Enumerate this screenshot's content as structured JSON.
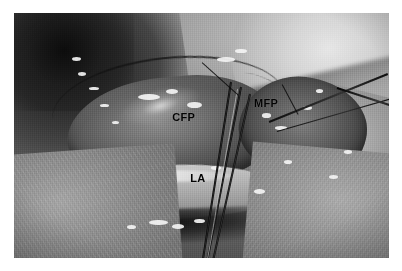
{
  "figure": {
    "kind": "clinical-photograph",
    "modality": "intraoperative grayscale photograph",
    "alt": "Grayscale intraoperative photograph of a surgical field showing exposed fat pads retracted with forceps, annotated with three anatomical abbreviations",
    "background_color": "#ffffff",
    "border_color": "#ffffff",
    "tone": "grayscale"
  },
  "photo": {
    "x": 14,
    "y": 13,
    "width": 375,
    "height": 245
  },
  "labels": [
    {
      "id": "cfp",
      "text": "CFP",
      "meaning": "central fat pad",
      "x_pct": 42.2,
      "y_pct": 40.5,
      "color": "#0a0a09"
    },
    {
      "id": "mfp",
      "text": "MFP",
      "meaning": "medial fat pad",
      "x_pct": 64.0,
      "y_pct": 34.5,
      "color": "#0a0a09"
    },
    {
      "id": "la",
      "text": "LA",
      "meaning": "lower alveolus",
      "x_pct": 47.0,
      "y_pct": 65.5,
      "color": "#0a0a09"
    }
  ],
  "pointers": [
    {
      "id": "pointer-cfp",
      "target": "CFP"
    },
    {
      "id": "pointer-mfp",
      "target": "MFP"
    }
  ],
  "instruments": [
    {
      "id": "forceps",
      "description": "fine forceps entering from lower right, three dark shafts"
    },
    {
      "id": "suture-retractor-right",
      "description": "thin dark retractor / suture at right edge"
    }
  ],
  "regions": [
    {
      "id": "dark-upper-left",
      "description": "dark haemorrhagic tissue, upper left"
    },
    {
      "id": "bright-upper-right",
      "description": "pale smooth rounded soft-tissue mass, upper right"
    },
    {
      "id": "cfp-lobe",
      "description": "central lobulated fat pad"
    },
    {
      "id": "mfp-lobe",
      "description": "medial fat pad lobe"
    },
    {
      "id": "la-band",
      "description": "pale lower alveolar band"
    },
    {
      "id": "lower-dark-band",
      "description": "dark band with specular highlights along lower margin"
    }
  ],
  "specular_highlights": [
    {
      "x_pct": 33.0,
      "y_pct": 33.0,
      "w": 6.0,
      "h": 2.6
    },
    {
      "x_pct": 40.5,
      "y_pct": 31.0,
      "w": 3.2,
      "h": 2.0
    },
    {
      "x_pct": 46.0,
      "y_pct": 36.5,
      "w": 4.0,
      "h": 2.4
    },
    {
      "x_pct": 54.0,
      "y_pct": 18.0,
      "w": 5.0,
      "h": 2.0
    },
    {
      "x_pct": 59.0,
      "y_pct": 14.5,
      "w": 3.0,
      "h": 1.8
    },
    {
      "x_pct": 66.0,
      "y_pct": 41.0,
      "w": 2.6,
      "h": 1.8
    },
    {
      "x_pct": 69.5,
      "y_pct": 46.0,
      "w": 3.4,
      "h": 1.6
    },
    {
      "x_pct": 77.0,
      "y_pct": 38.0,
      "w": 2.4,
      "h": 1.6
    },
    {
      "x_pct": 80.5,
      "y_pct": 31.0,
      "w": 2.0,
      "h": 1.6
    },
    {
      "x_pct": 17.0,
      "y_pct": 24.0,
      "w": 2.2,
      "h": 1.6
    },
    {
      "x_pct": 20.0,
      "y_pct": 30.0,
      "w": 2.6,
      "h": 1.6
    },
    {
      "x_pct": 23.0,
      "y_pct": 37.0,
      "w": 2.2,
      "h": 1.5
    },
    {
      "x_pct": 26.0,
      "y_pct": 44.0,
      "w": 2.0,
      "h": 1.5
    },
    {
      "x_pct": 15.5,
      "y_pct": 18.0,
      "w": 2.4,
      "h": 1.6
    },
    {
      "x_pct": 36.0,
      "y_pct": 84.5,
      "w": 5.0,
      "h": 2.2
    },
    {
      "x_pct": 42.0,
      "y_pct": 86.0,
      "w": 3.4,
      "h": 2.0
    },
    {
      "x_pct": 48.0,
      "y_pct": 84.0,
      "w": 3.0,
      "h": 1.8
    },
    {
      "x_pct": 30.0,
      "y_pct": 86.5,
      "w": 2.6,
      "h": 1.8
    },
    {
      "x_pct": 52.5,
      "y_pct": 62.5,
      "w": 2.6,
      "h": 1.6
    },
    {
      "x_pct": 64.0,
      "y_pct": 72.0,
      "w": 3.0,
      "h": 1.8
    },
    {
      "x_pct": 72.0,
      "y_pct": 60.0,
      "w": 2.2,
      "h": 1.5
    },
    {
      "x_pct": 84.0,
      "y_pct": 66.0,
      "w": 2.4,
      "h": 1.6
    },
    {
      "x_pct": 88.0,
      "y_pct": 56.0,
      "w": 2.0,
      "h": 1.4
    }
  ]
}
